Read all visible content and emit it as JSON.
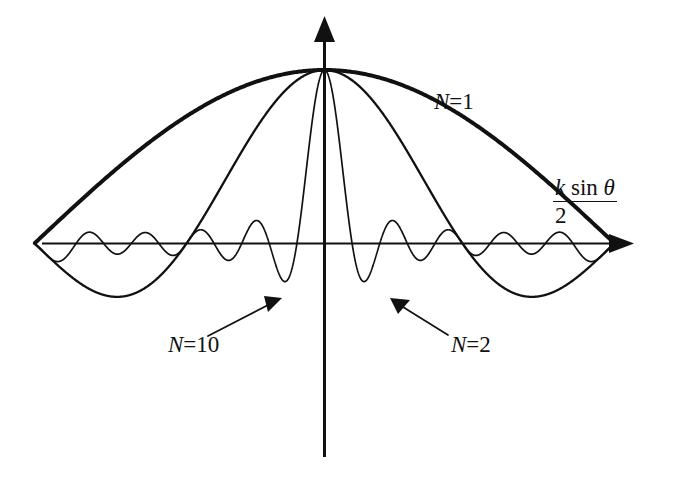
{
  "figure": {
    "kind": "array-factor-radiation-pattern",
    "background_color": "#ffffff",
    "ink_color": "#111111",
    "axis": {
      "x_axis_label_numerator_k": "k",
      "x_axis_label_numerator_sin": "sin",
      "x_axis_label_numerator_theta": "θ",
      "x_axis_label_denominator": "2",
      "x_axis_label_plain": "k sin θ / 2",
      "has_horizontal_arrow": true,
      "has_vertical_arrow": true
    },
    "annotations": [
      {
        "id": "n1",
        "var": "N",
        "eq": "=",
        "num": "1",
        "text": "N=1",
        "has_leader": false
      },
      {
        "id": "n10",
        "var": "N",
        "eq": "=",
        "num": "10",
        "text": "N=10",
        "has_leader": true
      },
      {
        "id": "n2",
        "var": "N",
        "eq": "=",
        "num": "2",
        "text": "N=2",
        "has_leader": true
      }
    ]
  },
  "chart_data": {
    "type": "line",
    "title": "",
    "subtitle": "",
    "xlabel": "k sin θ / 2",
    "ylabel": "",
    "grid": false,
    "legend_position": "inline-annotations",
    "x": {
      "min": -3.2,
      "max": 3.2,
      "unit": "radians",
      "tick_labels": []
    },
    "y": {
      "min": -0.55,
      "max": 1.0,
      "tick_labels": [],
      "peak_value": 1.0
    },
    "series": [
      {
        "name": "N=1",
        "label": "N=1",
        "stroke_width": 4.0,
        "formula": "cos(u)",
        "peak_x": 0.0,
        "peak_y": 1.0,
        "samples_x": [
          -3.2,
          -2.8,
          -2.4,
          -2.0,
          -1.6,
          -1.2,
          -0.8,
          -0.4,
          0.0,
          0.4,
          0.8,
          1.2,
          1.6,
          2.0,
          2.4,
          2.8,
          3.2
        ],
        "samples_y": [
          -0.998,
          -0.942,
          -0.737,
          -0.416,
          -0.029,
          0.362,
          0.697,
          0.921,
          1.0,
          0.921,
          0.697,
          0.362,
          -0.029,
          -0.416,
          -0.737,
          -0.942,
          -0.998
        ]
      },
      {
        "name": "N=2",
        "label": "N=2",
        "stroke_width": 2.3,
        "formula": "cos(u) * cos(2.1 u)",
        "peak_x": 0.0,
        "peak_y": 1.0,
        "lobe_count": 5,
        "null_positions": [
          -2.24,
          -0.75,
          0.75,
          2.24
        ]
      },
      {
        "name": "N=10",
        "label": "N=10",
        "stroke_width": 1.7,
        "formula": "cos(u) * sin(10.5 u) / (10.5 sin(u))",
        "peak_x": 0.0,
        "peak_y": 1.0,
        "sidelobe_count": 18,
        "grating_lobe_positions": [
          -1.55,
          1.55
        ],
        "grating_lobe_height": 0.42
      }
    ]
  }
}
